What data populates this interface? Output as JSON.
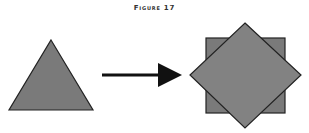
{
  "figure": {
    "title": "Figure 17",
    "colors": {
      "shape_fill": "#7a7a7a",
      "shape_stroke": "#222222",
      "arrow": "#111111"
    },
    "shapes": [
      {
        "name": "triangle",
        "role": "input"
      },
      {
        "name": "square",
        "role": "output-back"
      },
      {
        "name": "diamond",
        "role": "output-front"
      }
    ],
    "arrow": {
      "direction": "right"
    }
  }
}
